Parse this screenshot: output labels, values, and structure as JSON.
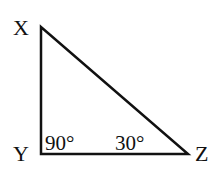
{
  "diagram": {
    "type": "right-triangle",
    "vertices": [
      {
        "name": "X",
        "x": 41,
        "y": 27,
        "label_x": 13,
        "label_y": 35
      },
      {
        "name": "Y",
        "x": 41,
        "y": 154,
        "label_x": 13,
        "label_y": 161
      },
      {
        "name": "Z",
        "x": 188,
        "y": 154,
        "label_x": 195,
        "label_y": 161
      }
    ],
    "angles": [
      {
        "vertex": "Y",
        "label": "90°",
        "x": 45,
        "y": 150
      },
      {
        "vertex": "Z",
        "label": "30°",
        "x": 115,
        "y": 150
      }
    ],
    "stroke_color": "#111111"
  }
}
